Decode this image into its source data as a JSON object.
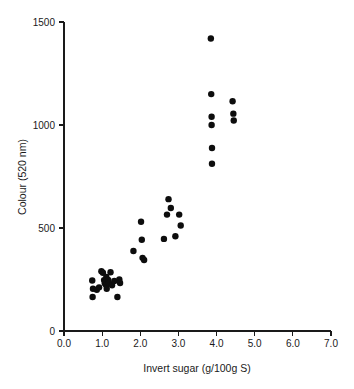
{
  "chart_data": {
    "type": "scatter",
    "title": "",
    "xlabel": "Invert sugar (g/100g S)",
    "ylabel": "Colour (520 nm)",
    "xlim": [
      0.0,
      7.0
    ],
    "ylim": [
      0,
      1500
    ],
    "xticks": [
      0.0,
      1.0,
      2.0,
      3.0,
      4.0,
      5.0,
      6.0,
      7.0
    ],
    "xticklabels": [
      "0.0",
      "1.0",
      "2.0",
      "3.0",
      "4.0",
      "5.0",
      "6.0",
      "7.0"
    ],
    "yticks": [
      0,
      500,
      1000,
      1500
    ],
    "yticklabels": [
      "0",
      "500",
      "1000",
      "1500"
    ],
    "grid": false,
    "legend": false,
    "marker": "filled-circle",
    "marker_color": "#0d0d0d",
    "marker_size_px": 4.2,
    "series": [
      {
        "name": "samples",
        "points": [
          [
            0.74,
            245
          ],
          [
            0.76,
            205
          ],
          [
            0.75,
            165
          ],
          [
            0.86,
            200
          ],
          [
            0.92,
            212
          ],
          [
            0.98,
            290
          ],
          [
            1.02,
            283
          ],
          [
            1.05,
            247
          ],
          [
            1.07,
            232
          ],
          [
            1.09,
            238
          ],
          [
            1.1,
            225
          ],
          [
            1.11,
            262
          ],
          [
            1.12,
            205
          ],
          [
            1.16,
            248
          ],
          [
            1.18,
            232
          ],
          [
            1.22,
            285
          ],
          [
            1.26,
            222
          ],
          [
            1.32,
            243
          ],
          [
            1.4,
            165
          ],
          [
            1.45,
            250
          ],
          [
            1.47,
            233
          ],
          [
            1.82,
            388
          ],
          [
            2.02,
            530
          ],
          [
            2.04,
            443
          ],
          [
            2.06,
            355
          ],
          [
            2.1,
            345
          ],
          [
            2.62,
            447
          ],
          [
            2.7,
            565
          ],
          [
            2.74,
            640
          ],
          [
            2.8,
            597
          ],
          [
            2.92,
            460
          ],
          [
            3.02,
            565
          ],
          [
            3.06,
            512
          ],
          [
            3.85,
            1420
          ],
          [
            3.86,
            1150
          ],
          [
            3.87,
            1040
          ],
          [
            3.87,
            1000
          ],
          [
            3.88,
            888
          ],
          [
            3.88,
            812
          ],
          [
            4.42,
            1115
          ],
          [
            4.44,
            1055
          ],
          [
            4.45,
            1022
          ]
        ]
      }
    ]
  },
  "figure": {
    "background": "#ffffff",
    "axis_color": "#1a1a1a"
  }
}
